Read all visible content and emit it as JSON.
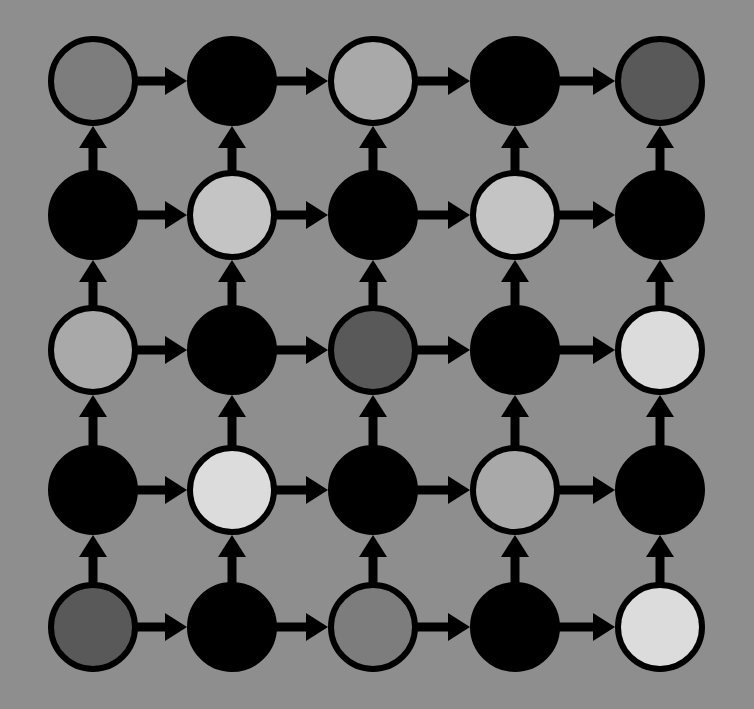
{
  "diagram": {
    "type": "grid-directed-graph",
    "rows": 5,
    "cols": 5,
    "background": "#8e8e8e",
    "node_radius": 42,
    "node_stroke": "#000000",
    "node_stroke_width": 6,
    "col_x": [
      93,
      232,
      373,
      515,
      660
    ],
    "row_y": [
      81,
      215,
      350,
      490,
      627
    ],
    "palette": {
      "black": "#000000",
      "dark": "#595959",
      "mid": "#7d7d7d",
      "light": "#a9a9a9",
      "lighter": "#c4c4c4",
      "lightest": "#dcdcdc"
    },
    "nodes": [
      [
        "mid",
        "black",
        "light",
        "black",
        "dark"
      ],
      [
        "black",
        "lighter",
        "black",
        "lighter",
        "black"
      ],
      [
        "light",
        "black",
        "dark",
        "black",
        "lightest"
      ],
      [
        "black",
        "lightest",
        "black",
        "light",
        "black"
      ],
      [
        "dark",
        "black",
        "mid",
        "black",
        "lightest"
      ]
    ],
    "edges": {
      "horizontal": "left-to-right along every row",
      "vertical": "bottom-to-top along every column"
    },
    "arrow_color": "#000000"
  }
}
